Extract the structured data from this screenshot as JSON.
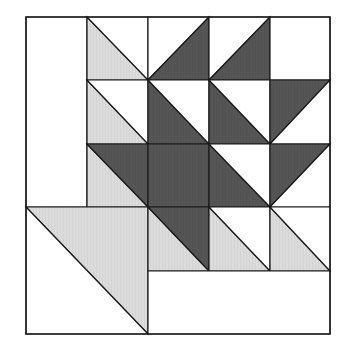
{
  "diagram": {
    "type": "quilt-block",
    "grid": {
      "cols": 5,
      "rows": 5
    },
    "xs": [
      26,
      87,
      148,
      209,
      270,
      330
    ],
    "ys": [
      17,
      80,
      144,
      207,
      271,
      334
    ],
    "colors": {
      "dark": "#555555",
      "light": "#dcdcdc",
      "white": "#ffffff",
      "stroke": "#1a1a1a"
    },
    "pieces": [
      {
        "name": "tall-white-rect",
        "fill": "white",
        "pts": [
          [
            0,
            0
          ],
          [
            1,
            0
          ],
          [
            1,
            3
          ],
          [
            0,
            3
          ]
        ]
      },
      {
        "name": "r0c1-light-tri",
        "fill": "light",
        "pts": [
          [
            1,
            0
          ],
          [
            2,
            1
          ],
          [
            1,
            1
          ]
        ]
      },
      {
        "name": "r0c1-white-tri",
        "fill": "white",
        "pts": [
          [
            1,
            0
          ],
          [
            2,
            0
          ],
          [
            2,
            1
          ]
        ]
      },
      {
        "name": "r0c2-white-tri",
        "fill": "white",
        "pts": [
          [
            2,
            0
          ],
          [
            3,
            0
          ],
          [
            2,
            1
          ]
        ]
      },
      {
        "name": "r0c2-dark-tri",
        "fill": "dark",
        "pts": [
          [
            3,
            0
          ],
          [
            3,
            1
          ],
          [
            2,
            1
          ]
        ]
      },
      {
        "name": "r0c3-white-tri",
        "fill": "white",
        "pts": [
          [
            3,
            0
          ],
          [
            4,
            0
          ],
          [
            3,
            1
          ]
        ]
      },
      {
        "name": "r0c3-dark-tri",
        "fill": "dark",
        "pts": [
          [
            4,
            0
          ],
          [
            4,
            1
          ],
          [
            3,
            1
          ]
        ]
      },
      {
        "name": "r0c4-white-square",
        "fill": "white",
        "pts": [
          [
            4,
            0
          ],
          [
            5,
            0
          ],
          [
            5,
            1
          ],
          [
            4,
            1
          ]
        ]
      },
      {
        "name": "r1c1-light-tri",
        "fill": "light",
        "pts": [
          [
            1,
            1
          ],
          [
            2,
            2
          ],
          [
            1,
            2
          ]
        ]
      },
      {
        "name": "r1c1-white-tri",
        "fill": "white",
        "pts": [
          [
            1,
            1
          ],
          [
            2,
            1
          ],
          [
            2,
            2
          ]
        ]
      },
      {
        "name": "r1c2-dark-tri",
        "fill": "dark",
        "pts": [
          [
            2,
            1
          ],
          [
            3,
            2
          ],
          [
            2,
            2
          ]
        ]
      },
      {
        "name": "r1c2-white-tri",
        "fill": "white",
        "pts": [
          [
            2,
            1
          ],
          [
            3,
            1
          ],
          [
            3,
            2
          ]
        ]
      },
      {
        "name": "r1c3-dark-tri",
        "fill": "dark",
        "pts": [
          [
            3,
            1
          ],
          [
            4,
            2
          ],
          [
            3,
            2
          ]
        ]
      },
      {
        "name": "r1c3-white-tri",
        "fill": "white",
        "pts": [
          [
            3,
            1
          ],
          [
            4,
            1
          ],
          [
            4,
            2
          ]
        ]
      },
      {
        "name": "r1c4-dark-tri",
        "fill": "dark",
        "pts": [
          [
            4,
            1
          ],
          [
            5,
            1
          ],
          [
            4,
            2
          ]
        ]
      },
      {
        "name": "r1c4-white-tri",
        "fill": "white",
        "pts": [
          [
            5,
            1
          ],
          [
            5,
            2
          ],
          [
            4,
            2
          ]
        ]
      },
      {
        "name": "r2c1-light-tri",
        "fill": "light",
        "pts": [
          [
            1,
            2
          ],
          [
            2,
            3
          ],
          [
            1,
            3
          ]
        ]
      },
      {
        "name": "r2c1-dark-tri",
        "fill": "dark",
        "pts": [
          [
            1,
            2
          ],
          [
            2,
            2
          ],
          [
            2,
            3
          ]
        ]
      },
      {
        "name": "r2c2-dark-square",
        "fill": "dark",
        "pts": [
          [
            2,
            2
          ],
          [
            3,
            2
          ],
          [
            3,
            3
          ],
          [
            2,
            3
          ]
        ]
      },
      {
        "name": "r2c3-dark-tri",
        "fill": "dark",
        "pts": [
          [
            3,
            2
          ],
          [
            4,
            3
          ],
          [
            3,
            3
          ]
        ]
      },
      {
        "name": "r2c3-white-tri",
        "fill": "white",
        "pts": [
          [
            3,
            2
          ],
          [
            4,
            2
          ],
          [
            4,
            3
          ]
        ]
      },
      {
        "name": "r2c4-dark-tri",
        "fill": "dark",
        "pts": [
          [
            4,
            2
          ],
          [
            5,
            2
          ],
          [
            4,
            3
          ]
        ]
      },
      {
        "name": "r2c4-white-tri",
        "fill": "white",
        "pts": [
          [
            5,
            2
          ],
          [
            5,
            3
          ],
          [
            4,
            3
          ]
        ]
      },
      {
        "name": "big-light-tri",
        "fill": "light",
        "pts": [
          [
            0,
            3
          ],
          [
            2,
            3
          ],
          [
            2,
            5
          ]
        ]
      },
      {
        "name": "big-white-tri",
        "fill": "white",
        "pts": [
          [
            0,
            3
          ],
          [
            2,
            5
          ],
          [
            0,
            5
          ]
        ]
      },
      {
        "name": "r3c2-light-tri",
        "fill": "light",
        "pts": [
          [
            2,
            3
          ],
          [
            3,
            4
          ],
          [
            2,
            4
          ]
        ]
      },
      {
        "name": "r3c2-dark-tri",
        "fill": "dark",
        "pts": [
          [
            2,
            3
          ],
          [
            3,
            3
          ],
          [
            3,
            4
          ]
        ]
      },
      {
        "name": "r3c3-light-tri",
        "fill": "light",
        "pts": [
          [
            3,
            3
          ],
          [
            4,
            4
          ],
          [
            3,
            4
          ]
        ]
      },
      {
        "name": "r3c3-white-tri",
        "fill": "white",
        "pts": [
          [
            3,
            3
          ],
          [
            4,
            3
          ],
          [
            4,
            4
          ]
        ]
      },
      {
        "name": "r3c4-light-tri",
        "fill": "light",
        "pts": [
          [
            4,
            3
          ],
          [
            5,
            4
          ],
          [
            4,
            4
          ]
        ]
      },
      {
        "name": "r3c4-white-tri",
        "fill": "white",
        "pts": [
          [
            4,
            3
          ],
          [
            5,
            3
          ],
          [
            5,
            4
          ]
        ]
      },
      {
        "name": "bottom-white-rect",
        "fill": "white",
        "pts": [
          [
            2,
            4
          ],
          [
            5,
            4
          ],
          [
            5,
            5
          ],
          [
            2,
            5
          ]
        ]
      }
    ]
  }
}
